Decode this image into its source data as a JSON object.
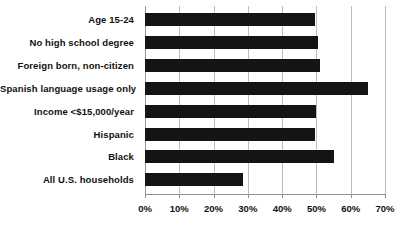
{
  "chart_data": {
    "type": "bar",
    "orientation": "horizontal",
    "title": "",
    "xlabel": "",
    "ylabel": "",
    "categories": [
      "Age 15-24",
      "No high school degree",
      "Foreign born, non-citizen",
      "Spanish language usage only",
      "Income <$15,000/year",
      "Hispanic",
      "Black",
      "All U.S. households"
    ],
    "values": [
      49.5,
      50.5,
      51,
      65,
      50,
      49.5,
      55,
      28.5
    ],
    "xlim": [
      0,
      70
    ],
    "xticks": [
      0,
      10,
      20,
      30,
      40,
      50,
      60,
      70
    ],
    "xtick_labels": [
      "0%",
      "10%",
      "20%",
      "30%",
      "40%",
      "50%",
      "60%",
      "70%"
    ],
    "grid": true,
    "grid_axis": "x",
    "legend": null,
    "bar_color": "#141414",
    "grid_color": "#bdbdbd",
    "axis_color": "#8f8f8f",
    "background_color": "#ffffff"
  }
}
